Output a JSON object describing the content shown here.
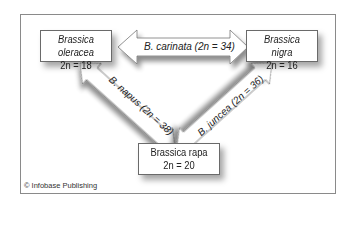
{
  "diagram": {
    "nodes": [
      {
        "id": "oleracea",
        "name": "Brassica oleracea",
        "chromosomes": "2n = 18",
        "italic": true
      },
      {
        "id": "nigra",
        "name": "Brassica nigra",
        "chromosomes": "2n = 16",
        "italic": true
      },
      {
        "id": "rapa",
        "name": "Brassica rapa",
        "chromosomes": "2n = 20",
        "italic": false
      }
    ],
    "edges": [
      {
        "from": "oleracea",
        "to": "nigra",
        "label": "B. carinata (2n = 34)",
        "direction": "both"
      },
      {
        "from": "oleracea",
        "to": "rapa",
        "label": "B. napus (2n = 38)",
        "direction": "both"
      },
      {
        "from": "nigra",
        "to": "rapa",
        "label": "B. juncea (2n = 36)",
        "direction": "both"
      }
    ],
    "credit": "© Infobase Publishing"
  }
}
